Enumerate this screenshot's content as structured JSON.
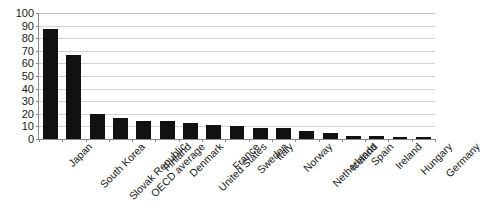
{
  "chart_data": {
    "type": "bar",
    "title": "",
    "subtitle": "",
    "xlabel": "",
    "ylabel": "",
    "ylim": [
      0,
      100
    ],
    "ytick_step": 10,
    "yticks": [
      0,
      10,
      20,
      30,
      40,
      50,
      60,
      70,
      80,
      90,
      100
    ],
    "ytick_labels": [
      "0",
      "10",
      "20",
      "30",
      "40",
      "50",
      "60",
      "70",
      "80",
      "90",
      "100"
    ],
    "grid": true,
    "grid_axis": "y",
    "legend": false,
    "legend_position": "none",
    "annotations": [],
    "bar_color": "#111111",
    "grid_color": "#d2d2d2",
    "axis_color": "#8a8a8a",
    "categories": [
      "Japan",
      "South Korea",
      "Slovak Republic",
      "OECD average",
      "Finland",
      "Denmark",
      "United States",
      "France",
      "Sweden",
      "Italy",
      "Norway",
      "Netherlands",
      "Iceland",
      "Spain",
      "Ireland",
      "Hungary",
      "Germany"
    ],
    "values": [
      87,
      67,
      20,
      17,
      14,
      14,
      13,
      11,
      10,
      9,
      9,
      6,
      5,
      2.5,
      2,
      1.5,
      1.5
    ]
  }
}
